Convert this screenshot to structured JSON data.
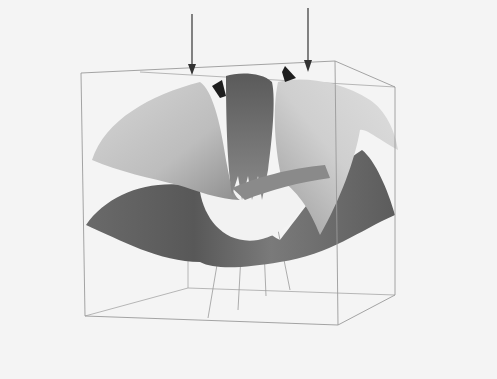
{
  "figure": {
    "background": "#f4f4f4",
    "box_color": "#9a9a9a",
    "arrow_color": "#333333",
    "arrows": [
      {
        "x": 192,
        "y_start": 14,
        "y_end": 74
      },
      {
        "x": 308,
        "y_start": 8,
        "y_end": 72
      }
    ]
  }
}
